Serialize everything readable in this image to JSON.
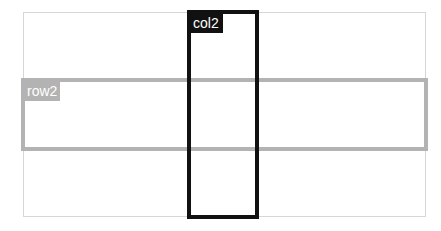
{
  "diagram": {
    "row_label": "row2",
    "col_label": "col2",
    "colors": {
      "row_border": "#b3b3b3",
      "col_border": "#111111",
      "outer_border": "#d6d6d6"
    }
  }
}
